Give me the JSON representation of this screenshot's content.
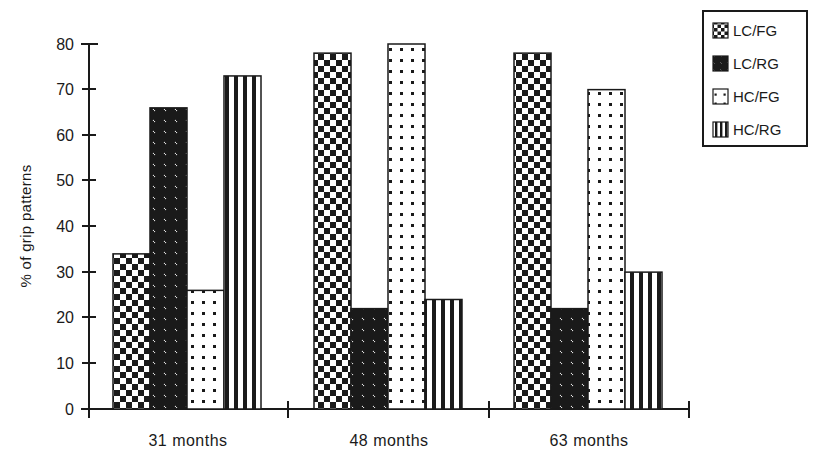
{
  "chart_data": {
    "type": "bar",
    "title": "",
    "xlabel": "",
    "ylabel": "% of grip patterns",
    "ylim": [
      0,
      80
    ],
    "yticks": [
      0,
      10,
      20,
      30,
      40,
      50,
      60,
      70,
      80
    ],
    "ytick_labels": [
      "0",
      "10",
      "20",
      "30",
      "40",
      "50",
      "60",
      "70",
      "80"
    ],
    "grid": false,
    "legend_position": "top-right",
    "categories": [
      "31 months",
      "48 months",
      "63 months"
    ],
    "series": [
      {
        "name": "LC/FG",
        "pattern": "checkerboard",
        "values": [
          34,
          78,
          78
        ]
      },
      {
        "name": "LC/RG",
        "pattern": "diagonal-hatch",
        "values": [
          66,
          22,
          22
        ]
      },
      {
        "name": "HC/FG",
        "pattern": "dots",
        "values": [
          26,
          80,
          70
        ]
      },
      {
        "name": "HC/RG",
        "pattern": "vertical-stripes",
        "values": [
          73,
          24,
          30
        ]
      }
    ]
  },
  "axis": {
    "y_title": "% of grip patterns",
    "y_tick_0": "0",
    "y_tick_10": "10",
    "y_tick_20": "20",
    "y_tick_30": "30",
    "y_tick_40": "40",
    "y_tick_50": "50",
    "y_tick_60": "60",
    "y_tick_70": "70",
    "y_tick_80": "80"
  },
  "categories": {
    "g0": "31 months",
    "g1": "48 months",
    "g2": "63 months"
  },
  "legend": {
    "items": [
      {
        "label": "LC/FG",
        "swatch": "checkerboard-swatch"
      },
      {
        "label": "LC/RG",
        "swatch": "diagonal-hatch-swatch"
      },
      {
        "label": "HC/FG",
        "swatch": "dots-swatch"
      },
      {
        "label": "HC/RG",
        "swatch": "vertical-stripes-swatch"
      }
    ]
  },
  "colors": {
    "ink": "#1a1a1a",
    "paper": "#ffffff"
  }
}
